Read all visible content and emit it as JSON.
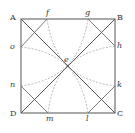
{
  "diagram": {
    "type": "geometric-construction",
    "colors": {
      "line": "#555555",
      "dashed": "#999999",
      "text": "#333333"
    },
    "vertices": {
      "A": {
        "label": "A",
        "x": 21,
        "y": 19
      },
      "B": {
        "label": "B",
        "x": 115,
        "y": 19
      },
      "C": {
        "label": "C",
        "x": 115,
        "y": 113
      },
      "D": {
        "label": "D",
        "x": 21,
        "y": 113
      }
    },
    "center": {
      "label": "e",
      "x": 67,
      "y": 66
    },
    "side_points": {
      "f": {
        "label": "f",
        "x": 47,
        "y": 19
      },
      "g": {
        "label": "g",
        "x": 88,
        "y": 19
      },
      "h": {
        "label": "h",
        "x": 115,
        "y": 46
      },
      "k": {
        "label": "k",
        "x": 115,
        "y": 86
      },
      "l": {
        "label": "l",
        "x": 88,
        "y": 113
      },
      "m": {
        "label": "m",
        "x": 48,
        "y": 113
      },
      "n": {
        "label": "n",
        "x": 21,
        "y": 86
      },
      "o": {
        "label": "o",
        "x": 21,
        "y": 47
      }
    },
    "labels": {
      "A": "A",
      "B": "B",
      "C": "C",
      "D": "D",
      "e": "e",
      "f": "f",
      "g": "g",
      "h": "h",
      "k": "k",
      "l": "l",
      "m": "m",
      "n": "n",
      "o": "o"
    }
  }
}
